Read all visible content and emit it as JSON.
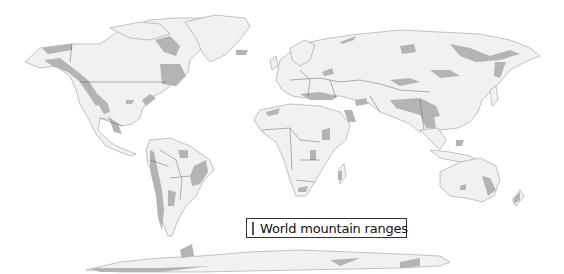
{
  "map": {
    "type": "world political outline map",
    "colors": {
      "land": "#f1f1f1",
      "mountains": "#b4b4b4",
      "border": "#555555",
      "background": "#ffffff"
    }
  },
  "legend": {
    "items": [
      {
        "label": "World mountain ranges",
        "color": "#b0b0b0"
      }
    ]
  }
}
